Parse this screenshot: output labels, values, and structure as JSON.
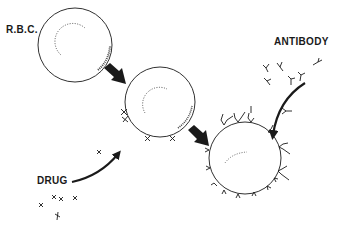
{
  "labels": {
    "rbc": "R.B.C.",
    "antibody": "ANTIBODY",
    "drug": "DRUG"
  },
  "colors": {
    "ink": "#1a1a1a",
    "background": "#ffffff"
  },
  "diagram": {
    "stages": [
      {
        "name": "rbc",
        "label": "R.B.C."
      },
      {
        "name": "drug-coated-rbc"
      },
      {
        "name": "antibody-coated-rbc"
      }
    ]
  }
}
